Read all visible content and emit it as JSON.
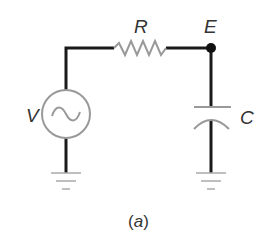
{
  "diagram": {
    "type": "circuit",
    "caption": "(a)",
    "caption_parts": {
      "open": "(",
      "letter": "a",
      "close": ")"
    },
    "labels": {
      "source": "V",
      "resistor": "R",
      "node": "E",
      "capacitor": "C"
    },
    "components": [
      {
        "id": "source",
        "kind": "ac-voltage-source",
        "label": "V"
      },
      {
        "id": "resistor",
        "kind": "resistor",
        "label": "R"
      },
      {
        "id": "node",
        "kind": "junction-node",
        "label": "E"
      },
      {
        "id": "capacitor",
        "kind": "capacitor",
        "label": "C"
      },
      {
        "id": "ground-left",
        "kind": "ground"
      },
      {
        "id": "ground-right",
        "kind": "ground"
      }
    ],
    "colors": {
      "wire": "#1a1a1a",
      "component": "#999999",
      "text": "#333333",
      "ground": "#aaaaaa"
    }
  }
}
